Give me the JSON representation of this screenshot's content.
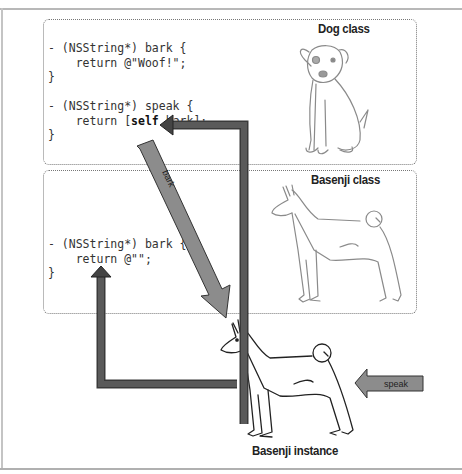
{
  "diagram": {
    "dog_class": {
      "title": "Dog class",
      "code": [
        "- (NSString*) bark {",
        "    return @\"Woof!\";",
        "}",
        "",
        "- (NSString*) speak {",
        "    return [self bark];",
        "}"
      ],
      "bark_line1": "- (NSString*) bark {",
      "bark_line2": "    return @\"Woof!\";",
      "bark_line3": "}",
      "speak_line1": "- (NSString*) speak {",
      "speak_line2_pre": "    return [",
      "speak_line2_kw": "self",
      "speak_line2_post": " bark];",
      "speak_line3": "}"
    },
    "basenji_class": {
      "title": "Basenji class",
      "bark_line1": "- (NSString*) bark {",
      "bark_line2": "    return @\"\";",
      "bark_line3": "}"
    },
    "instance": {
      "title": "Basenji instance"
    },
    "arrows": {
      "bark_label": "bark",
      "speak_label": "speak"
    },
    "colors": {
      "arrow_dark": "#555555",
      "arrow_light": "#8a8a8a",
      "box_border": "#777777",
      "drawing_stroke": "#888888"
    }
  }
}
